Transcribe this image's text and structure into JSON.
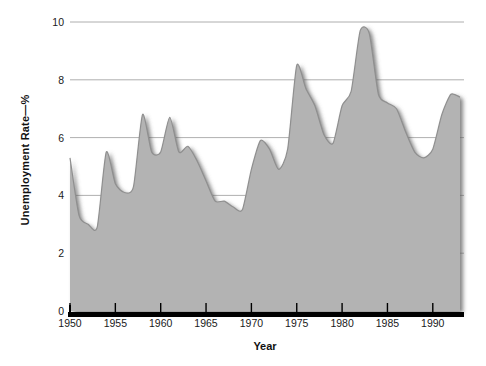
{
  "chart_data": {
    "type": "area",
    "title": "",
    "xlabel": "Year",
    "ylabel": "Unemployment Rate—%",
    "xlim": [
      1950,
      1993
    ],
    "ylim": [
      0,
      10
    ],
    "grid": true,
    "legend": "none",
    "y_ticks": [
      "0",
      "2",
      "4",
      "6",
      "8",
      "10"
    ],
    "y_tick_values": [
      0,
      2,
      4,
      6,
      8,
      10
    ],
    "x_ticks": [
      "1950",
      "1955",
      "1960",
      "1965",
      "1970",
      "1975",
      "1980",
      "1985",
      "1990"
    ],
    "x_tick_values": [
      1950,
      1955,
      1960,
      1965,
      1970,
      1975,
      1980,
      1985,
      1990
    ],
    "series": [
      {
        "name": "Unemployment Rate",
        "x": [
          1950,
          1951,
          1952,
          1953,
          1954,
          1955,
          1956,
          1957,
          1958,
          1959,
          1960,
          1961,
          1962,
          1963,
          1964,
          1965,
          1966,
          1967,
          1968,
          1969,
          1970,
          1971,
          1972,
          1973,
          1974,
          1975,
          1976,
          1977,
          1978,
          1979,
          1980,
          1981,
          1982,
          1983,
          1984,
          1985,
          1986,
          1987,
          1988,
          1989,
          1990,
          1991,
          1992,
          1993
        ],
        "values": [
          5.3,
          3.3,
          3.0,
          2.9,
          5.5,
          4.4,
          4.1,
          4.3,
          6.8,
          5.5,
          5.5,
          6.7,
          5.5,
          5.7,
          5.2,
          4.5,
          3.8,
          3.8,
          3.6,
          3.5,
          4.9,
          5.9,
          5.6,
          4.9,
          5.6,
          8.5,
          7.7,
          7.1,
          6.1,
          5.8,
          7.1,
          7.6,
          9.7,
          9.6,
          7.5,
          7.2,
          7.0,
          6.2,
          5.5,
          5.3,
          5.6,
          6.8,
          7.5,
          7.4
        ]
      }
    ]
  },
  "axes": {
    "y_title": "Unemployment Rate—%",
    "x_title": "Year"
  },
  "colors": {
    "area_fill": "#b3b3b3",
    "grid": "#9a9a9a",
    "axis": "#000000",
    "text": "#1a1a1a",
    "background": "#ffffff"
  }
}
